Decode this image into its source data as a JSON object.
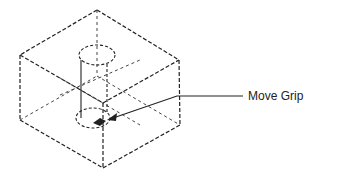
{
  "diagram": {
    "callout": {
      "label": "Move Grip"
    },
    "elements": [
      "wireframe-cube",
      "cylinder-hole",
      "move-grip-marker",
      "leader-arrow"
    ],
    "colors": {
      "line": "#222222",
      "background": "#ffffff"
    }
  }
}
